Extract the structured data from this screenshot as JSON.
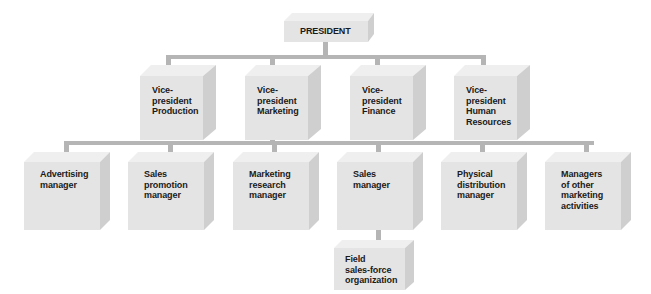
{
  "chart": {
    "root": {
      "label": "PRESIDENT"
    },
    "vice_presidents": [
      {
        "label": "Vice-\npresident\nProduction"
      },
      {
        "label": "Vice-\npresident\nMarketing"
      },
      {
        "label": "Vice-\npresident\nFinance"
      },
      {
        "label": "Vice-\npresident\nHuman\nResources"
      }
    ],
    "marketing_managers": [
      {
        "label": "Advertising\nmanager"
      },
      {
        "label": "Sales\npromotion\nmanager"
      },
      {
        "label": "Marketing\nresearch\nmanager"
      },
      {
        "label": "Sales\nmanager"
      },
      {
        "label": "Physical\ndistribution\nmanager"
      },
      {
        "label": "Managers\nof other\nmarketing\nactivities"
      }
    ],
    "sales_subordinate": {
      "label": "Field\nsales-force\norganization"
    }
  },
  "colors": {
    "connector": "#b5b5b5",
    "box_front": "#e4e4e4",
    "box_top": "#efefef",
    "box_side": "#cfcfcf",
    "text": "#1a1a1a"
  }
}
